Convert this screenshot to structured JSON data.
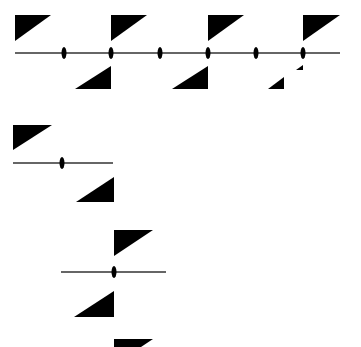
{
  "diagram": {
    "colors": {
      "fill": "#000000",
      "line": "#333333",
      "background": "#ffffff"
    },
    "panels": [
      {
        "name": "multi-span-beam",
        "line": {
          "x1": 15,
          "x2": 340,
          "y": 53
        },
        "hinges": [
          64,
          111,
          160,
          208,
          256,
          303
        ],
        "triangles_top": [
          {
            "points": "15,15 51,15 15,41"
          },
          {
            "points": "111,15 147,15 111,41"
          },
          {
            "points": "208,15 244,15 208,41"
          },
          {
            "points": "303,15 340,15 303,41"
          }
        ],
        "triangles_bottom": [
          {
            "points": "111,66 111,89 75,89"
          },
          {
            "points": "208,66 208,89 172,89"
          },
          {
            "points": "284,77 284,89 268,89"
          },
          {
            "points": "303,65 303,70 296,70"
          }
        ]
      },
      {
        "name": "single-span-beam",
        "line": {
          "x1": 13,
          "x2": 113,
          "y": 163
        },
        "hinges": [
          62
        ],
        "triangles_top": [
          {
            "points": "13,125 52,125 13,150"
          }
        ],
        "triangles_bottom": [
          {
            "points": "114,177 114,202 76,202"
          }
        ]
      },
      {
        "name": "cantilever-hinge-beam",
        "line": {
          "x1": 61,
          "x2": 166,
          "y": 272
        },
        "hinges": [
          114
        ],
        "triangles_top": [
          {
            "points": "114,230 153,230 114,256"
          },
          {
            "points": "114,339 153,339 141,347 114,347"
          }
        ],
        "triangles_bottom": [
          {
            "points": "114,291 114,317 74,317"
          }
        ]
      }
    ]
  }
}
